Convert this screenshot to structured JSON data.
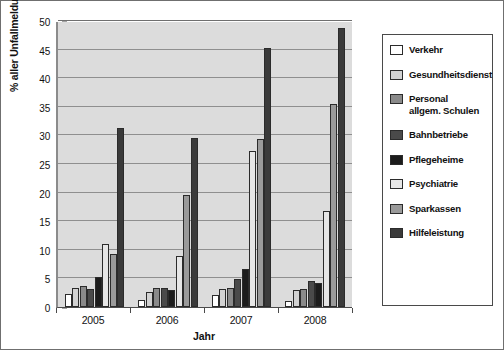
{
  "chart_data": {
    "type": "bar",
    "title": "",
    "xlabel": "Jahr",
    "ylabel": "% aller Unfallmeldungen",
    "categories": [
      "2005",
      "2006",
      "2007",
      "2008"
    ],
    "ylim": [
      0,
      50
    ],
    "yticks": [
      0,
      5,
      10,
      15,
      20,
      25,
      30,
      35,
      40,
      45,
      50
    ],
    "grid": true,
    "legend_position": "right",
    "series": [
      {
        "name": "Verkehr",
        "color": "#ffffff",
        "values": [
          2.3,
          1.2,
          2.1,
          1.1
        ]
      },
      {
        "name": "Gesundheitsdienst",
        "color": "#d2d2d2",
        "values": [
          3.4,
          2.6,
          3.2,
          2.9
        ]
      },
      {
        "name": "Personal allgem. Schulen",
        "color": "#8a8a8a",
        "values": [
          3.6,
          3.3,
          3.4,
          3.1
        ]
      },
      {
        "name": "Bahnbetriebe",
        "color": "#4a4a4a",
        "values": [
          3.1,
          3.4,
          4.9,
          4.5
        ]
      },
      {
        "name": "Pflegeheime",
        "color": "#1c1c1c",
        "values": [
          5.2,
          3.0,
          6.6,
          4.2
        ]
      },
      {
        "name": "Psychiatrie",
        "color": "#e6e6e6",
        "values": [
          11.0,
          9.0,
          27.3,
          16.7
        ]
      },
      {
        "name": "Sparkassen",
        "color": "#9a9a9a",
        "values": [
          9.3,
          19.5,
          29.3,
          35.5
        ]
      },
      {
        "name": "Hilfeleistung",
        "color": "#3a3a3a",
        "values": [
          31.3,
          29.5,
          45.2,
          48.8
        ]
      }
    ]
  },
  "legend": {
    "items": [
      {
        "label": "Verkehr",
        "label_line2": ""
      },
      {
        "label": "Gesundheitsdienst",
        "label_line2": ""
      },
      {
        "label": "Personal",
        "label_line2": "allgem. Schulen"
      },
      {
        "label": "Bahnbetriebe",
        "label_line2": ""
      },
      {
        "label": "Pflegeheime",
        "label_line2": ""
      },
      {
        "label": "Psychiatrie",
        "label_line2": ""
      },
      {
        "label": "Sparkassen",
        "label_line2": ""
      },
      {
        "label": "Hilfeleistung",
        "label_line2": ""
      }
    ]
  },
  "axes": {
    "y_title": "% aller Unfallmeldungen",
    "x_title": "Jahr"
  },
  "colors": {
    "plot_background": "#dcdcdc",
    "gridline": "#8f8f8f",
    "axis": "#4a4a4a",
    "border": "#6f6f6f"
  }
}
